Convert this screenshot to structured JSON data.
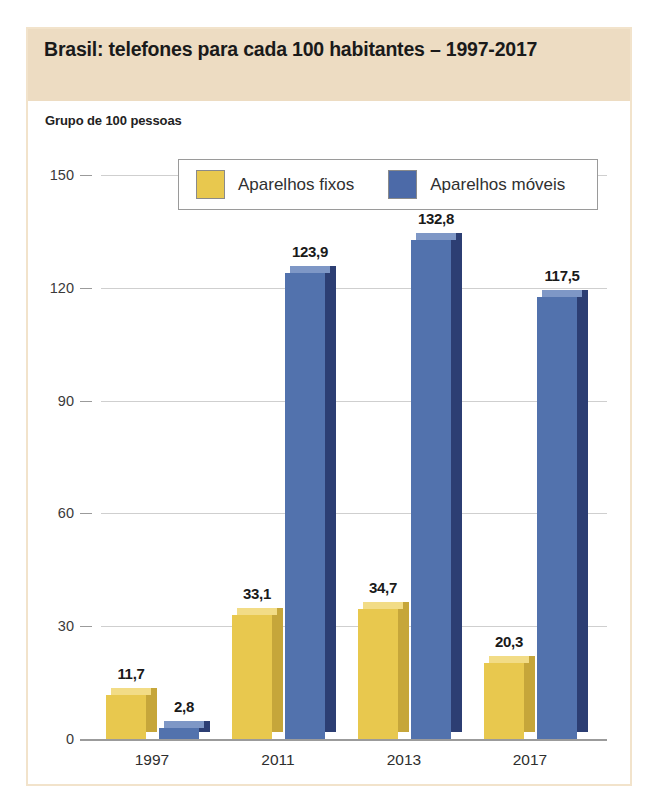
{
  "card": {
    "title": "Brasil: telefones para cada 100 habitantes – 1997-2017",
    "subtitle": "Grupo de 100 pessoas"
  },
  "chart_data": {
    "type": "bar",
    "title": "Brasil: telefones para cada 100 habitantes – 1997-2017",
    "subtitle": "Grupo de 100 pessoas",
    "xlabel": "",
    "ylabel": "",
    "ylim": [
      0,
      150
    ],
    "yticks": [
      "0",
      "30",
      "60",
      "90",
      "120",
      "150"
    ],
    "ytick_values": [
      0,
      30,
      60,
      90,
      120,
      150
    ],
    "grid": true,
    "legend_position": "top-center",
    "categories": [
      "1997",
      "2011",
      "2013",
      "2017"
    ],
    "series": [
      {
        "name": "Aparelhos fixos",
        "color": "#E8C84E",
        "values": [
          11.7,
          33.1,
          34.7,
          20.3
        ],
        "labels": [
          "11,7",
          "33,1",
          "34,7",
          "20,3"
        ]
      },
      {
        "name": "Aparelhos móveis",
        "color": "#4C6AA8",
        "values": [
          2.8,
          123.9,
          132.8,
          117.5
        ],
        "labels": [
          "2,8",
          "123,9",
          "132,8",
          "117,5"
        ]
      }
    ]
  },
  "legend": {
    "items": [
      {
        "label": "Aparelhos fixos",
        "color": "#E8C84E"
      },
      {
        "label": "Aparelhos móveis",
        "color": "#4C6AA8"
      }
    ]
  },
  "colors": {
    "title_band": "#EDDCC2",
    "card_border": "#F2E3CB",
    "yellow": "#E8C84E",
    "blue": "#4C6AA8",
    "gridline": "#cfcfcf"
  }
}
